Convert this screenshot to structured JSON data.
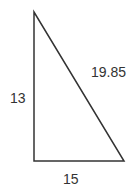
{
  "diagram": {
    "type": "right-triangle",
    "stroke_color": "#333333",
    "vertices": {
      "top": [
        34,
        12
      ],
      "right_angle": [
        34,
        161
      ],
      "bottom_right": [
        124,
        161
      ]
    },
    "sides": {
      "vertical": {
        "label": "13"
      },
      "horizontal": {
        "label": "15"
      },
      "hypotenuse": {
        "label": "19.85"
      }
    }
  }
}
